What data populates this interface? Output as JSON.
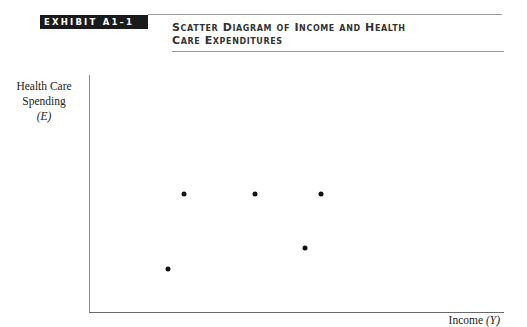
{
  "exhibit": {
    "label": "EXHIBIT A1–1",
    "title_line1": "Scatter Diagram of Income and Health",
    "title_line2": "Care Expenditures"
  },
  "chart_data": {
    "type": "scatter",
    "title": "Scatter Diagram of Income and Health Care Expenditures",
    "xlabel": "Income (Y)",
    "ylabel": "Health Care Spending (E)",
    "grid": false,
    "legend": null,
    "tick_labels": {
      "x": [],
      "y": []
    },
    "note": "Axes unlabeled numerically; coordinates are relative positions on a 0–100 scale (origin at axis intersection).",
    "xlim": [
      0,
      100
    ],
    "ylim": [
      0,
      100
    ],
    "points": [
      {
        "x": 19,
        "y": 18
      },
      {
        "x": 23,
        "y": 50
      },
      {
        "x": 40,
        "y": 50
      },
      {
        "x": 52,
        "y": 27
      },
      {
        "x": 56,
        "y": 50
      }
    ]
  },
  "axes": {
    "y_label_line1": "Health Care",
    "y_label_line2": "Spending",
    "y_label_var": "(E)",
    "x_label_text": "Income ",
    "x_label_var": "(Y)"
  }
}
